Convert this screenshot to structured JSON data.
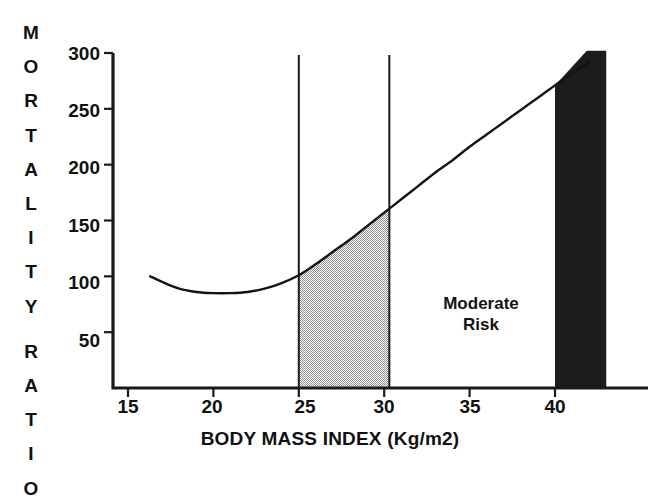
{
  "axis": {
    "y_title_lines": [
      "M",
      "O",
      "R",
      "T",
      "A",
      "L",
      "I",
      "T",
      "Y",
      "R",
      "A",
      "T",
      "I",
      "O"
    ],
    "y_title_text": "MORTALITY RATIO",
    "y_ticks": [
      50,
      100,
      150,
      200,
      250,
      300
    ],
    "x_title": "BODY MASS INDEX  (Kg/m2)",
    "x_ticks": [
      15,
      20,
      25,
      30,
      35,
      40
    ]
  },
  "zones": {
    "low": {
      "label_line1": "Low",
      "label_line2": "Risk",
      "fill": "#c9c9c9",
      "range": [
        25,
        30.3
      ]
    },
    "moderate": {
      "label_line1": "Moderate",
      "label_line2": "Risk",
      "fill": "#ffffff",
      "range": [
        30.3,
        40
      ]
    },
    "high": {
      "label_line1": "High",
      "label_line2": "Risk",
      "fill": "#1c1c1c",
      "range": [
        40,
        43.0
      ]
    }
  },
  "chart_data": {
    "type": "line",
    "title": "",
    "subtitle": "",
    "xlabel": "BODY MASS INDEX  (Kg/m2)",
    "ylabel": "MORTALITY RATIO",
    "xlim": [
      14.0,
      43.0
    ],
    "ylim": [
      0,
      300
    ],
    "xticks": [
      15,
      20,
      25,
      30,
      35,
      40
    ],
    "yticks": [
      50,
      100,
      150,
      200,
      250,
      300
    ],
    "grid": false,
    "legend": null,
    "series": [
      {
        "name": "Mortality ratio vs BMI",
        "x": [
          16.3,
          17.0,
          18.0,
          19.0,
          20.0,
          21.0,
          22.0,
          23.0,
          24.0,
          25.0,
          26.0,
          27.0,
          28.0,
          29.0,
          30.0,
          31.0,
          32.0,
          33.0,
          34.0,
          35.0,
          36.0,
          37.0,
          38.0,
          39.0,
          40.0,
          41.0,
          42.0
        ],
        "y": [
          100,
          95,
          89,
          86,
          85,
          85,
          86,
          89,
          94,
          101,
          111,
          122,
          133,
          145,
          157,
          169,
          181,
          193,
          204,
          216,
          227,
          238,
          249,
          260,
          271,
          282,
          292
        ]
      }
    ],
    "annotations": [
      {
        "text": "Low Risk",
        "x_range": [
          25,
          30.3
        ],
        "shading": "#c9c9c9"
      },
      {
        "text": "Moderate Risk",
        "x_range": [
          30.3,
          40
        ],
        "shading": "#ffffff"
      },
      {
        "text": "High Risk",
        "x_range": [
          40,
          43.0
        ],
        "shading": "#1c1c1c"
      }
    ],
    "dividers_x": [
      25,
      30.3,
      40
    ]
  }
}
